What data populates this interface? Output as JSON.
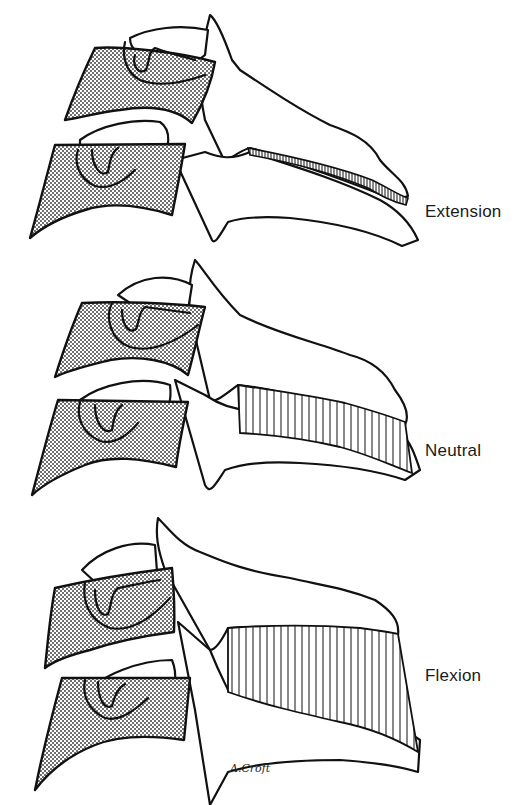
{
  "figure": {
    "panels": [
      {
        "id": "extension",
        "label": "Extension"
      },
      {
        "id": "neutral",
        "label": "Neutral"
      },
      {
        "id": "flexion",
        "label": "Flexion"
      }
    ],
    "signature": "A.Croft",
    "colors": {
      "ink": "#111111",
      "background": "#ffffff"
    }
  }
}
